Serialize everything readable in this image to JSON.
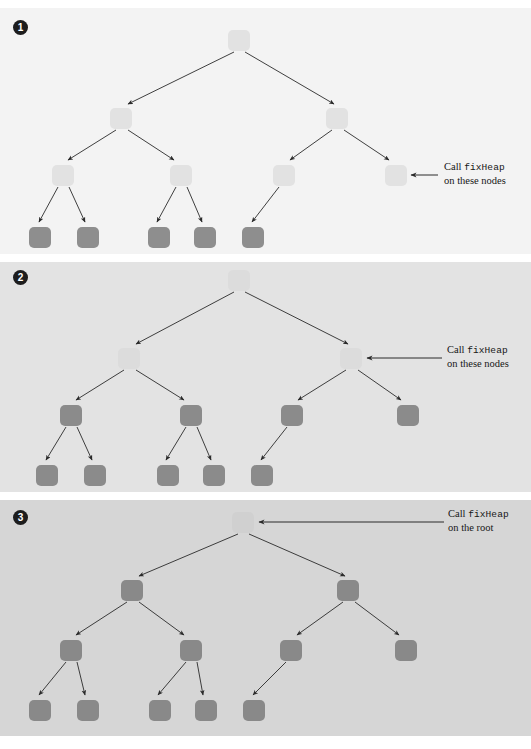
{
  "figure": {
    "panels": [
      {
        "badge": "1",
        "callout": {
          "line1_prefix": "Call ",
          "line1_code": "fixHeap",
          "line2": "on these nodes"
        },
        "background": "#f3f3f3",
        "light_node_color": "#e2e2e2",
        "dark_node_color": "#8e8e8e",
        "nodes": [
          {
            "level": 0,
            "x": 228,
            "y": 22,
            "shade": "light"
          },
          {
            "level": 1,
            "x": 110,
            "y": 100,
            "shade": "light"
          },
          {
            "level": 1,
            "x": 326,
            "y": 100,
            "shade": "light"
          },
          {
            "level": 2,
            "x": 52,
            "y": 157,
            "shade": "light"
          },
          {
            "level": 2,
            "x": 170,
            "y": 157,
            "shade": "light"
          },
          {
            "level": 2,
            "x": 273,
            "y": 157,
            "shade": "light"
          },
          {
            "level": 2,
            "x": 385,
            "y": 157,
            "shade": "light"
          },
          {
            "level": 3,
            "x": 29,
            "y": 219,
            "shade": "dark"
          },
          {
            "level": 3,
            "x": 77,
            "y": 219,
            "shade": "dark"
          },
          {
            "level": 3,
            "x": 148,
            "y": 219,
            "shade": "dark"
          },
          {
            "level": 3,
            "x": 194,
            "y": 219,
            "shade": "dark"
          },
          {
            "level": 3,
            "x": 242,
            "y": 219,
            "shade": "dark"
          }
        ]
      },
      {
        "badge": "2",
        "callout": {
          "line1_prefix": "Call ",
          "line1_code": "fixHeap",
          "line2": "on these nodes"
        },
        "background": "#e3e3e3",
        "light_node_color": "#dcdcdc",
        "dark_node_color": "#8b8b8b",
        "nodes": [
          {
            "level": 0,
            "x": 228,
            "y": 8,
            "shade": "light"
          },
          {
            "level": 1,
            "x": 118,
            "y": 86,
            "shade": "light"
          },
          {
            "level": 1,
            "x": 340,
            "y": 86,
            "shade": "light"
          },
          {
            "level": 2,
            "x": 60,
            "y": 143,
            "shade": "dark"
          },
          {
            "level": 2,
            "x": 180,
            "y": 143,
            "shade": "dark"
          },
          {
            "level": 2,
            "x": 281,
            "y": 143,
            "shade": "dark"
          },
          {
            "level": 2,
            "x": 397,
            "y": 143,
            "shade": "dark"
          },
          {
            "level": 3,
            "x": 36,
            "y": 203,
            "shade": "dark"
          },
          {
            "level": 3,
            "x": 84,
            "y": 203,
            "shade": "dark"
          },
          {
            "level": 3,
            "x": 157,
            "y": 203,
            "shade": "dark"
          },
          {
            "level": 3,
            "x": 203,
            "y": 203,
            "shade": "dark"
          },
          {
            "level": 3,
            "x": 251,
            "y": 203,
            "shade": "dark"
          }
        ]
      },
      {
        "badge": "3",
        "callout": {
          "line1_prefix": "Call ",
          "line1_code": "fixHeap",
          "line2": "on the root"
        },
        "background": "#d6d6d6",
        "light_node_color": "#d0d0d0",
        "dark_node_color": "#898989",
        "nodes": [
          {
            "level": 0,
            "x": 232,
            "y": 12,
            "shade": "light"
          },
          {
            "level": 1,
            "x": 121,
            "y": 80,
            "shade": "dark"
          },
          {
            "level": 1,
            "x": 337,
            "y": 80,
            "shade": "dark"
          },
          {
            "level": 2,
            "x": 60,
            "y": 140,
            "shade": "dark"
          },
          {
            "level": 2,
            "x": 180,
            "y": 140,
            "shade": "dark"
          },
          {
            "level": 2,
            "x": 280,
            "y": 140,
            "shade": "dark"
          },
          {
            "level": 2,
            "x": 395,
            "y": 140,
            "shade": "dark"
          },
          {
            "level": 3,
            "x": 29,
            "y": 200,
            "shade": "dark"
          },
          {
            "level": 3,
            "x": 77,
            "y": 200,
            "shade": "dark"
          },
          {
            "level": 3,
            "x": 149,
            "y": 200,
            "shade": "dark"
          },
          {
            "level": 3,
            "x": 195,
            "y": 200,
            "shade": "dark"
          },
          {
            "level": 3,
            "x": 243,
            "y": 200,
            "shade": "dark"
          }
        ]
      }
    ],
    "caption": ""
  }
}
